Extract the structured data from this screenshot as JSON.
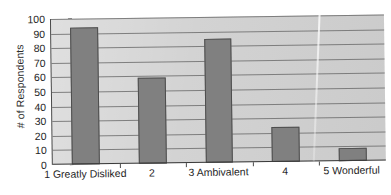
{
  "chart_data": {
    "type": "bar",
    "title": "",
    "subtitle": "",
    "xlabel": "",
    "ylabel": "# of Respondents",
    "categories": [
      "1 Greatly Disliked",
      "2",
      "3 Ambivalent",
      "4",
      "5 Wonderful"
    ],
    "values": [
      94,
      59,
      85,
      24,
      9
    ],
    "series": [
      {
        "name": "Respondents",
        "values": [
          94,
          59,
          85,
          24,
          9
        ]
      }
    ],
    "ylim": [
      0,
      100
    ],
    "ytick_labels": [
      "100",
      "90",
      "80",
      "70",
      "60",
      "50",
      "40",
      "30",
      "20",
      "10",
      "0"
    ],
    "ytick_values": [
      100,
      90,
      80,
      70,
      60,
      50,
      40,
      30,
      20,
      10,
      0
    ],
    "ytick_step": 10,
    "grid": true,
    "grid_axis": "y",
    "legend": false,
    "legend_position": "none",
    "bar_color": "#808080",
    "bar_border_color": "#4d4d4d",
    "plot_background_color": "#d2d2d2",
    "axis_color": "#3a3a3a",
    "gridline_color": "#6e6e6e",
    "text_color": "#1f1f1f",
    "page_background_color": "#ffffff"
  }
}
